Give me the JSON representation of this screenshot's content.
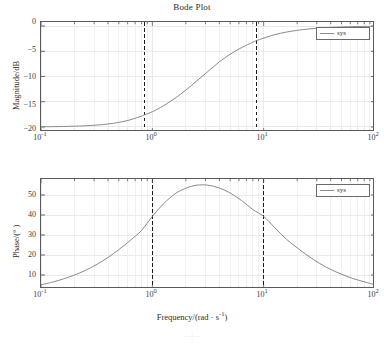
{
  "figure": {
    "title": "Bode Plot",
    "width": 384,
    "height": 345,
    "background": "#ffffff",
    "curve_color": "#8a8a8a",
    "axis_color": "#5a5a5a",
    "grid_color": "#e8e8e8",
    "marker_color": "#1a1a1a"
  },
  "axis": {
    "xlabel": "Frequency/(rad · s",
    "xlabel_exp": "-1",
    "xlabel_tail": ")",
    "xlabel_full": "Frequency/(rad · s⁻¹)",
    "mag_ylabel": "Magnitude/dB",
    "pha_ylabel": "Phase/(° )",
    "xticks": [
      "10",
      "10",
      "10",
      "10"
    ],
    "xtick_exps": [
      "-1",
      "0",
      "1",
      "2"
    ],
    "xtick_values": [
      0.1,
      1,
      10,
      100
    ],
    "mag_yticks": [
      "0",
      "−5",
      "−10",
      "−15",
      "−20"
    ],
    "pha_yticks": [
      "50",
      "40",
      "30",
      "20",
      "10"
    ]
  },
  "legend": {
    "mag_label": "sys",
    "pha_label": "sys"
  },
  "markers": {
    "style": "dashed",
    "mag_lines": [
      0.85,
      8.6
    ],
    "pha_lines": [
      1.0,
      10.0
    ]
  },
  "artifact": {
    "text": "─┼─"
  },
  "chart_data": [
    {
      "type": "line",
      "title": "Bode Plot",
      "subtitle": "Magnitude",
      "xlabel": "Frequency/(rad · s⁻¹)",
      "ylabel": "Magnitude/dB",
      "xscale": "log",
      "xlim": [
        0.1,
        100
      ],
      "ylim": [
        -21,
        0.8
      ],
      "yticks": [
        0,
        -5,
        -10,
        -15,
        -20
      ],
      "xticks": [
        0.1,
        1,
        10,
        100
      ],
      "grid": true,
      "legend": [
        "sys"
      ],
      "legend_position": "top-right",
      "annotations": [
        {
          "type": "vline",
          "x": 0.85,
          "style": "dashed"
        },
        {
          "type": "vline",
          "x": 8.6,
          "style": "dashed"
        }
      ],
      "series": [
        {
          "name": "sys",
          "x": [
            0.1,
            0.13,
            0.16,
            0.2,
            0.25,
            0.32,
            0.4,
            0.5,
            0.63,
            0.8,
            0.85,
            1.0,
            1.26,
            1.6,
            2.0,
            2.5,
            3.16,
            4.0,
            5.0,
            6.3,
            8.0,
            8.6,
            10.0,
            12.6,
            16.0,
            20.0,
            25.0,
            32.0,
            40.0,
            50.0,
            63.0,
            80.0,
            100.0
          ],
          "y": [
            -19.96,
            -19.94,
            -19.9,
            -19.85,
            -19.77,
            -19.62,
            -19.42,
            -19.1,
            -18.6,
            -17.85,
            -17.6,
            -16.98,
            -15.8,
            -14.3,
            -12.7,
            -10.9,
            -9.0,
            -7.1,
            -5.6,
            -4.3,
            -3.2,
            -2.9,
            -2.4,
            -1.7,
            -1.2,
            -0.85,
            -0.6,
            -0.4,
            -0.27,
            -0.18,
            -0.12,
            -0.08,
            -0.05
          ]
        }
      ]
    },
    {
      "type": "line",
      "subtitle": "Phase",
      "xlabel": "Frequency/(rad · s⁻¹)",
      "ylabel": "Phase/(° )",
      "xscale": "log",
      "xlim": [
        0.1,
        100
      ],
      "ylim": [
        3,
        58
      ],
      "yticks": [
        50,
        40,
        30,
        20,
        10
      ],
      "xticks": [
        0.1,
        1,
        10,
        100
      ],
      "grid": true,
      "legend": [
        "sys"
      ],
      "legend_position": "top-right",
      "annotations": [
        {
          "type": "vline",
          "x": 1.0,
          "style": "dashed"
        },
        {
          "type": "vline",
          "x": 10.0,
          "style": "dashed"
        }
      ],
      "series": [
        {
          "name": "sys",
          "x": [
            0.1,
            0.13,
            0.16,
            0.2,
            0.25,
            0.32,
            0.4,
            0.5,
            0.63,
            0.8,
            1.0,
            1.26,
            1.6,
            2.0,
            2.5,
            3.16,
            4.0,
            5.0,
            6.3,
            8.0,
            10.0,
            12.6,
            16.0,
            20.0,
            25.0,
            32.0,
            40.0,
            50.0,
            63.0,
            80.0,
            100.0
          ],
          "y": [
            5.1,
            6.6,
            8.1,
            10.0,
            12.3,
            15.4,
            18.8,
            22.7,
            27.2,
            32.3,
            39.3,
            45.6,
            50.6,
            53.4,
            54.9,
            54.9,
            53.5,
            51.0,
            47.3,
            42.7,
            39.3,
            33.6,
            27.9,
            23.6,
            19.6,
            15.7,
            12.8,
            10.4,
            8.3,
            6.6,
            5.1
          ]
        }
      ]
    }
  ]
}
